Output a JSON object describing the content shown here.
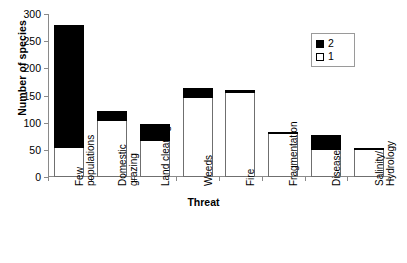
{
  "chart_data": {
    "type": "bar",
    "subtype": "stacked-vertical",
    "title": "",
    "xlabel": "Threat",
    "ylabel": "Number of species",
    "ylim": [
      0,
      300
    ],
    "yticks": [
      0,
      50,
      100,
      150,
      200,
      250,
      300
    ],
    "ytick_labels": [
      "0",
      "50",
      "100",
      "150",
      "200",
      "250",
      "300"
    ],
    "grid": false,
    "legend_position": "top-right",
    "categories": [
      "Few\npopulations",
      "Domestic\ngrazing",
      "Land clearing",
      "Weeds",
      "Fire",
      "Fragmentation",
      "Disease",
      "Salinity/\nHydrology"
    ],
    "series": [
      {
        "name": "1",
        "color": "#ffffff",
        "values": [
          53,
          103,
          67,
          145,
          155,
          79,
          50,
          51
        ]
      },
      {
        "name": "2",
        "color": "#000000",
        "values": [
          226,
          18,
          31,
          19,
          5,
          3,
          28,
          2
        ]
      }
    ],
    "totals": [
      279,
      121,
      98,
      164,
      160,
      82,
      78,
      53
    ]
  },
  "legend": {
    "entries": [
      {
        "label": "2",
        "swatch": "filled-square-icon"
      },
      {
        "label": "1",
        "swatch": "open-square-icon"
      }
    ]
  },
  "axes": {
    "y_title": "Number of species",
    "x_title": "Threat"
  }
}
